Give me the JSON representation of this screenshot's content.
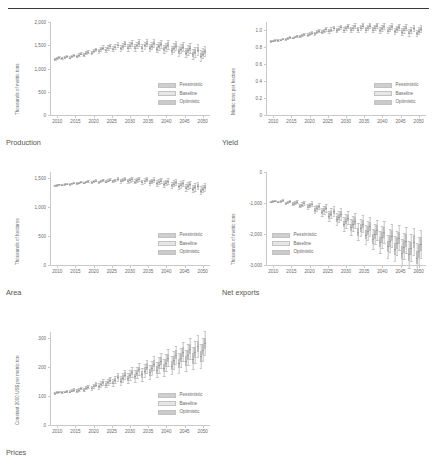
{
  "header": {
    "clipped_title_fragment": ""
  },
  "legend": {
    "entries": [
      {
        "label": "Pessimistic",
        "color": "#cfcfcf"
      },
      {
        "label": "Baseline",
        "color": "#e6e6e6"
      },
      {
        "label": "Optimistic",
        "color": "#cacaca"
      }
    ]
  },
  "captions": {
    "production": "Production",
    "yield": "Yield",
    "area": "Area",
    "net_exports": "Net exports",
    "prices": "Prices"
  },
  "chart_data": [
    {
      "id": "production",
      "type": "box",
      "title": "Production",
      "xlabel": "",
      "ylabel": "Thousands of metric tons",
      "ylim": [
        0,
        2000
      ],
      "yticks": [
        0,
        500,
        1000,
        1500,
        2000
      ],
      "ytick_labels": [
        "0",
        "500",
        "1,000",
        "1,500",
        "2,000"
      ],
      "xlim": [
        2008,
        2052
      ],
      "xticks": [
        2010,
        2015,
        2020,
        2025,
        2030,
        2035,
        2040,
        2045,
        2050
      ],
      "xtick_labels": [
        "2010",
        "2015",
        "2020",
        "2025",
        "2030",
        "2035",
        "2040",
        "2045",
        "2050"
      ],
      "grid": false,
      "legend_position": "lower right",
      "series": [
        {
          "name": "Pessimistic",
          "values": [
            1195,
            1215,
            1235,
            1265,
            1300,
            1340,
            1375,
            1400,
            1420,
            1435,
            1445,
            1450,
            1448,
            1440,
            1428,
            1412,
            1392,
            1368,
            1340,
            1310,
            1278
          ]
        },
        {
          "name": "Baseline",
          "values": [
            1218,
            1240,
            1262,
            1295,
            1335,
            1378,
            1415,
            1443,
            1465,
            1482,
            1493,
            1498,
            1497,
            1490,
            1478,
            1462,
            1442,
            1418,
            1388,
            1356,
            1322
          ]
        },
        {
          "name": "Optimistic",
          "values": [
            1240,
            1262,
            1288,
            1322,
            1365,
            1410,
            1450,
            1482,
            1508,
            1528,
            1542,
            1548,
            1548,
            1542,
            1530,
            1513,
            1492,
            1466,
            1436,
            1402,
            1366
          ]
        }
      ],
      "x_values": [
        2010,
        2012,
        2014,
        2016,
        2018,
        2020,
        2022,
        2024,
        2026,
        2028,
        2030,
        2032,
        2034,
        2036,
        2038,
        2040,
        2042,
        2044,
        2046,
        2048,
        2050
      ],
      "spread": [
        18,
        20,
        22,
        26,
        30,
        34,
        40,
        46,
        52,
        58,
        64,
        68,
        72,
        76,
        80,
        84,
        88,
        92,
        96,
        100,
        104
      ]
    },
    {
      "id": "yield",
      "type": "box",
      "title": "Yield",
      "xlabel": "",
      "ylabel": "Metric tons per hectare",
      "ylim": [
        0,
        1.1
      ],
      "yticks": [
        0,
        0.2,
        0.4,
        0.6,
        0.8,
        1.0
      ],
      "ytick_labels": [
        "0",
        "0.2",
        "0.4",
        "0.6",
        "0.8",
        "1.0"
      ],
      "xlim": [
        2008,
        2052
      ],
      "xticks": [
        2010,
        2015,
        2020,
        2025,
        2030,
        2035,
        2040,
        2045,
        2050
      ],
      "xtick_labels": [
        "2010",
        "2015",
        "2020",
        "2025",
        "2030",
        "2035",
        "2040",
        "2045",
        "2050"
      ],
      "grid": false,
      "legend_position": "lower right",
      "series": [
        {
          "name": "Pessimistic",
          "values": [
            0.872,
            0.884,
            0.897,
            0.913,
            0.93,
            0.948,
            0.965,
            0.98,
            0.992,
            1.0,
            1.006,
            1.009,
            1.01,
            1.009,
            1.006,
            1.002,
            0.996,
            0.99,
            0.982,
            0.974,
            0.966
          ]
        },
        {
          "name": "Baseline",
          "values": [
            0.88,
            0.893,
            0.907,
            0.924,
            0.942,
            0.961,
            0.98,
            0.996,
            1.01,
            1.02,
            1.027,
            1.031,
            1.033,
            1.033,
            1.031,
            1.027,
            1.022,
            1.016,
            1.008,
            1.0,
            0.992
          ]
        },
        {
          "name": "Optimistic",
          "values": [
            0.888,
            0.902,
            0.917,
            0.935,
            0.954,
            0.975,
            0.995,
            1.013,
            1.028,
            1.04,
            1.048,
            1.053,
            1.056,
            1.057,
            1.055,
            1.052,
            1.047,
            1.041,
            1.034,
            1.026,
            1.018
          ]
        }
      ],
      "x_values": [
        2010,
        2012,
        2014,
        2016,
        2018,
        2020,
        2022,
        2024,
        2026,
        2028,
        2030,
        2032,
        2034,
        2036,
        2038,
        2040,
        2042,
        2044,
        2046,
        2048,
        2050
      ],
      "spread": [
        0.008,
        0.009,
        0.01,
        0.012,
        0.014,
        0.016,
        0.018,
        0.02,
        0.022,
        0.024,
        0.026,
        0.028,
        0.03,
        0.031,
        0.032,
        0.033,
        0.034,
        0.035,
        0.036,
        0.037,
        0.038
      ]
    },
    {
      "id": "area",
      "type": "box",
      "title": "Area",
      "xlabel": "",
      "ylabel": "Thousands of hectares",
      "ylim": [
        0,
        1600
      ],
      "yticks": [
        0,
        500,
        1000,
        1500
      ],
      "ytick_labels": [
        "0",
        "500",
        "1,000",
        "1,500"
      ],
      "xlim": [
        2008,
        2052
      ],
      "xticks": [
        2010,
        2015,
        2020,
        2025,
        2030,
        2035,
        2040,
        2045,
        2050
      ],
      "xtick_labels": [
        "2010",
        "2015",
        "2020",
        "2025",
        "2030",
        "2035",
        "2040",
        "2045",
        "2050"
      ],
      "grid": false,
      "legend_position": "lower right",
      "series": [
        {
          "name": "Pessimistic",
          "values": [
            1368,
            1380,
            1392,
            1404,
            1414,
            1423,
            1430,
            1436,
            1440,
            1441,
            1439,
            1434,
            1427,
            1417,
            1405,
            1390,
            1373,
            1353,
            1331,
            1307,
            1281
          ]
        },
        {
          "name": "Baseline",
          "values": [
            1378,
            1391,
            1404,
            1417,
            1428,
            1438,
            1446,
            1453,
            1458,
            1460,
            1459,
            1455,
            1449,
            1440,
            1429,
            1415,
            1399,
            1380,
            1359,
            1336,
            1311
          ]
        },
        {
          "name": "Optimistic",
          "values": [
            1388,
            1402,
            1416,
            1430,
            1442,
            1453,
            1462,
            1470,
            1476,
            1479,
            1479,
            1476,
            1471,
            1463,
            1453,
            1440,
            1425,
            1407,
            1387,
            1365,
            1341
          ]
        }
      ],
      "x_values": [
        2010,
        2012,
        2014,
        2016,
        2018,
        2020,
        2022,
        2024,
        2026,
        2028,
        2030,
        2032,
        2034,
        2036,
        2038,
        2040,
        2042,
        2044,
        2046,
        2048,
        2050
      ],
      "spread": [
        10,
        11,
        12,
        14,
        16,
        18,
        20,
        23,
        26,
        29,
        32,
        35,
        38,
        41,
        44,
        47,
        50,
        53,
        56,
        59,
        62
      ]
    },
    {
      "id": "net_exports",
      "type": "box",
      "title": "Net exports",
      "xlabel": "",
      "ylabel": "Thousands of metric tons",
      "ylim": [
        -3000,
        0
      ],
      "yticks": [
        0,
        -1000,
        -2000,
        -3000
      ],
      "ytick_labels": [
        "0",
        "-1,000",
        "-2,000",
        "-3,000"
      ],
      "xlim": [
        2008,
        2052
      ],
      "xticks": [
        2010,
        2015,
        2020,
        2025,
        2030,
        2035,
        2040,
        2045,
        2050
      ],
      "xtick_labels": [
        "2010",
        "2015",
        "2020",
        "2025",
        "2030",
        "2035",
        "2040",
        "2045",
        "2050"
      ],
      "grid": false,
      "legend_position": "lower left",
      "series": [
        {
          "name": "Pessimistic",
          "values": [
            -960,
            -960,
            -1010,
            -1020,
            -1090,
            -1120,
            -1220,
            -1300,
            -1420,
            -1530,
            -1680,
            -1790,
            -1930,
            -2020,
            -2160,
            -2260,
            -2400,
            -2480,
            -2600,
            -2660,
            -2760
          ]
        },
        {
          "name": "Baseline",
          "values": [
            -940,
            -935,
            -980,
            -990,
            -1050,
            -1075,
            -1165,
            -1235,
            -1345,
            -1445,
            -1580,
            -1680,
            -1805,
            -1890,
            -2015,
            -2105,
            -2230,
            -2300,
            -2405,
            -2455,
            -2545
          ]
        },
        {
          "name": "Optimistic",
          "values": [
            -920,
            -912,
            -952,
            -958,
            -1012,
            -1032,
            -1112,
            -1172,
            -1272,
            -1362,
            -1482,
            -1572,
            -1682,
            -1758,
            -1868,
            -1948,
            -2058,
            -2120,
            -2210,
            -2250,
            -2330
          ]
        }
      ],
      "x_values": [
        2010,
        2012,
        2014,
        2016,
        2018,
        2020,
        2022,
        2024,
        2026,
        2028,
        2030,
        2032,
        2034,
        2036,
        2038,
        2040,
        2042,
        2044,
        2046,
        2048,
        2050
      ],
      "spread": [
        25,
        28,
        35,
        45,
        60,
        75,
        100,
        125,
        150,
        175,
        200,
        225,
        250,
        270,
        290,
        310,
        330,
        350,
        370,
        385,
        400
      ]
    },
    {
      "id": "prices",
      "type": "box",
      "title": "Prices",
      "xlabel": "",
      "ylabel": "Constant 2000 US$ per metric ton",
      "ylim": [
        0,
        320
      ],
      "yticks": [
        0,
        100,
        200,
        300
      ],
      "ytick_labels": [
        "0",
        "100",
        "200",
        "300"
      ],
      "xlim": [
        2008,
        2052
      ],
      "xticks": [
        2010,
        2015,
        2020,
        2025,
        2030,
        2035,
        2040,
        2045,
        2050
      ],
      "xtick_labels": [
        "2010",
        "2015",
        "2020",
        "2025",
        "2030",
        "2035",
        "2040",
        "2045",
        "2050"
      ],
      "grid": false,
      "legend_position": "lower right",
      "series": [
        {
          "name": "Pessimistic",
          "values": [
            110,
            112,
            115,
            118,
            122,
            127,
            133,
            139,
            146,
            153,
            160,
            167,
            174,
            181,
            189,
            196,
            204,
            212,
            220,
            228,
            236
          ]
        },
        {
          "name": "Baseline",
          "values": [
            112,
            115,
            118,
            122,
            127,
            133,
            140,
            147,
            155,
            163,
            171,
            179,
            187,
            196,
            205,
            214,
            223,
            232,
            241,
            250,
            259
          ]
        },
        {
          "name": "Optimistic",
          "values": [
            114,
            117,
            121,
            126,
            132,
            139,
            147,
            155,
            164,
            173,
            182,
            191,
            201,
            211,
            221,
            231,
            241,
            251,
            261,
            271,
            281
          ]
        }
      ],
      "x_values": [
        2010,
        2012,
        2014,
        2016,
        2018,
        2020,
        2022,
        2024,
        2026,
        2028,
        2030,
        2032,
        2034,
        2036,
        2038,
        2040,
        2042,
        2044,
        2046,
        2048,
        2050
      ],
      "spread": [
        3,
        3,
        4,
        5,
        6,
        7,
        9,
        10,
        12,
        14,
        16,
        18,
        20,
        22,
        24,
        26,
        28,
        30,
        32,
        34,
        36
      ]
    }
  ]
}
